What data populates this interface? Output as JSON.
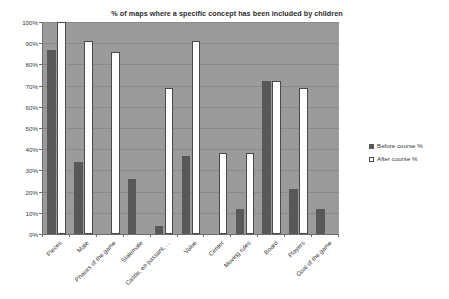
{
  "chart_data": {
    "type": "bar",
    "title": "% of maps where a specific concept has been included by children",
    "xlabel": "",
    "ylabel": "",
    "ylim": [
      0,
      100
    ],
    "ytick_labels": [
      "100%",
      "90%",
      "80%",
      "70%",
      "60%",
      "50%",
      "40%",
      "30%",
      "20%",
      "10%",
      "0%"
    ],
    "ytick_values": [
      100,
      90,
      80,
      70,
      60,
      50,
      40,
      30,
      20,
      10,
      0
    ],
    "grid": true,
    "legend_position": "right",
    "categories": [
      "Pieces",
      "Mate",
      "Phases of the game",
      "Stalemate",
      "Castle, en passant, ...",
      "Value",
      "Center",
      "Moving rules",
      "Board",
      "Players",
      "Goal of the game"
    ],
    "series": [
      {
        "name": "Before course %",
        "color": "#585858",
        "values": [
          87,
          34,
          0,
          26,
          4,
          37,
          0,
          12,
          72,
          21,
          12
        ]
      },
      {
        "name": "After course %",
        "color": "#fdfdfd",
        "values": [
          100,
          91,
          86,
          0,
          69,
          91,
          38,
          38,
          72,
          69,
          0
        ]
      }
    ]
  },
  "legend": {
    "items": [
      {
        "label": "Before course %",
        "swatch": "filled-square-icon"
      },
      {
        "label": "After course %",
        "swatch": "outlined-square-icon"
      }
    ]
  },
  "colors": {
    "plot_background": "#9b9b9b",
    "gridline": "#8a8a8a",
    "axis": "#6e6e6e",
    "text": "#3a3a3a",
    "title_text": "#2b2b2b",
    "series_before": "#585858",
    "series_after": "#fdfdfd"
  }
}
